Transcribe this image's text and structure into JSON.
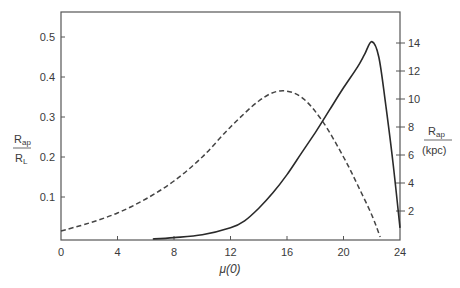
{
  "chart_data": {
    "type": "line",
    "title": "",
    "xlabel": "μ(0)",
    "ylabel_left": {
      "numerator": "R",
      "numerator_sub": "ap",
      "denominator": "R",
      "denominator_sub": "L"
    },
    "ylabel_right": {
      "numerator": "R",
      "numerator_sub": "ap",
      "denominator": "(kpc)"
    },
    "xlim": [
      0,
      24
    ],
    "ylim_left": [
      0,
      0.56
    ],
    "ylim_right": [
      0,
      15.7
    ],
    "x_ticks": [
      0,
      4,
      8,
      12,
      16,
      20,
      24
    ],
    "y_ticks_left": [
      0.1,
      0.2,
      0.3,
      0.4,
      0.5
    ],
    "y_ticks_right": [
      2,
      4,
      6,
      8,
      10,
      12,
      14
    ],
    "grid": false,
    "legend": null,
    "series": [
      {
        "name": "R_ap / R_L",
        "axis": "left",
        "style": "dashed",
        "x": [
          0,
          2,
          4,
          6,
          8,
          10,
          12,
          14,
          15.5,
          17,
          18.5,
          20,
          21,
          22,
          22.6
        ],
        "y": [
          0.015,
          0.035,
          0.06,
          0.095,
          0.14,
          0.2,
          0.275,
          0.34,
          0.365,
          0.35,
          0.29,
          0.2,
          0.13,
          0.055,
          0.0
        ]
      },
      {
        "name": "R_ap (kpc)",
        "axis": "right",
        "style": "solid",
        "x": [
          6.5,
          8,
          10,
          12,
          13,
          14,
          15,
          16,
          17,
          18,
          19,
          20,
          21,
          21.5,
          22,
          22.5,
          23,
          23.5,
          24
        ],
        "y": [
          0.0,
          0.1,
          0.3,
          0.8,
          1.3,
          2.2,
          3.3,
          4.6,
          6.1,
          7.6,
          9.2,
          10.8,
          12.3,
          13.2,
          14.1,
          13.0,
          9.5,
          5.5,
          0.8
        ]
      }
    ]
  }
}
